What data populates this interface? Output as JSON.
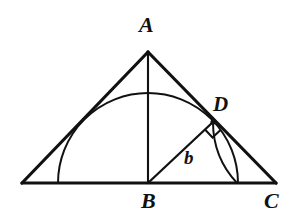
{
  "figure": {
    "kind": "geometry-diagram",
    "background_color": "#ffffff",
    "stroke_color": "#111111",
    "canvas": {
      "width": 293,
      "height": 218
    }
  },
  "labels": {
    "a": {
      "text": "A",
      "x": 139,
      "y": 14
    },
    "b_vertex": {
      "text": "B",
      "x": 141,
      "y": 190
    },
    "c": {
      "text": "C",
      "x": 264,
      "y": 190
    },
    "d": {
      "text": "D",
      "x": 213,
      "y": 94
    },
    "side_b": {
      "text": "b",
      "x": 184,
      "y": 148
    }
  },
  "geometry": {
    "points": {
      "A": {
        "x": 148,
        "y": 52
      },
      "B": {
        "x": 148,
        "y": 183
      },
      "C": {
        "x": 276,
        "y": 183
      },
      "D": {
        "x": 213,
        "y": 122
      },
      "left_base": {
        "x": 22,
        "y": 183
      }
    },
    "segments": [
      {
        "name": "base-line",
        "x1": 22,
        "y1": 183,
        "x2": 276,
        "y2": 183,
        "width": 3.2
      },
      {
        "name": "left-side-to-apex",
        "x1": 22,
        "y1": 183,
        "x2": 148,
        "y2": 52,
        "width": 3.2
      },
      {
        "name": "right-side-apex-to-c",
        "x1": 148,
        "y1": 52,
        "x2": 276,
        "y2": 183,
        "width": 3.2
      },
      {
        "name": "altitude-ab",
        "x1": 148,
        "y1": 52,
        "x2": 148,
        "y2": 183,
        "width": 2.1
      },
      {
        "name": "segment-bd",
        "x1": 148,
        "y1": 183,
        "x2": 213,
        "y2": 122,
        "width": 2.3
      }
    ],
    "arcs": [
      {
        "name": "large-semicircle",
        "center_x": 148,
        "center_y": 183,
        "radius": 90,
        "start_x": 58,
        "start_y": 183,
        "end_x": 238,
        "end_y": 183,
        "width": 2.0
      },
      {
        "name": "small-arc-bd-radius",
        "center_x": 148,
        "center_y": 183,
        "radius": 89,
        "start_x": 213,
        "start_y": 122,
        "end_x": 237,
        "end_y": 183,
        "width": 2.0
      }
    ],
    "right_angle_marker": {
      "name": "right-angle-at-d",
      "vertex_x": 213,
      "vertex_y": 122,
      "size": 11,
      "width": 2.0
    }
  }
}
